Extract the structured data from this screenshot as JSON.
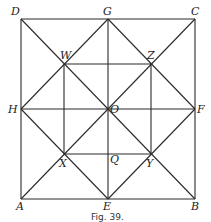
{
  "figure": {
    "caption": "Fig. 39.",
    "points": {
      "D": {
        "label": "D",
        "x": 21,
        "y": 19
      },
      "G": {
        "label": "G",
        "x": 108,
        "y": 19
      },
      "C": {
        "label": "C",
        "x": 195,
        "y": 19
      },
      "H": {
        "label": "H",
        "x": 21,
        "y": 109
      },
      "O": {
        "label": "O",
        "x": 108,
        "y": 109
      },
      "F": {
        "label": "F",
        "x": 195,
        "y": 109
      },
      "A": {
        "label": "A",
        "x": 21,
        "y": 199
      },
      "E": {
        "label": "E",
        "x": 108,
        "y": 199
      },
      "B": {
        "label": "B",
        "x": 195,
        "y": 199
      },
      "W": {
        "label": "W",
        "x": 64,
        "y": 64
      },
      "Z": {
        "label": "Z",
        "x": 151,
        "y": 64
      },
      "X": {
        "label": "X",
        "x": 64,
        "y": 154
      },
      "Y": {
        "label": "Y",
        "x": 151,
        "y": 154
      },
      "Q": {
        "label": "Q",
        "x": 108,
        "y": 154
      }
    },
    "segments": [
      [
        "D",
        "C"
      ],
      [
        "C",
        "B"
      ],
      [
        "B",
        "A"
      ],
      [
        "A",
        "D"
      ],
      [
        "D",
        "B"
      ],
      [
        "C",
        "A"
      ],
      [
        "G",
        "E"
      ],
      [
        "H",
        "F"
      ],
      [
        "G",
        "H"
      ],
      [
        "H",
        "E"
      ],
      [
        "E",
        "F"
      ],
      [
        "F",
        "G"
      ],
      [
        "W",
        "Z"
      ],
      [
        "X",
        "Y"
      ],
      [
        "W",
        "X"
      ],
      [
        "Z",
        "Y"
      ]
    ]
  }
}
